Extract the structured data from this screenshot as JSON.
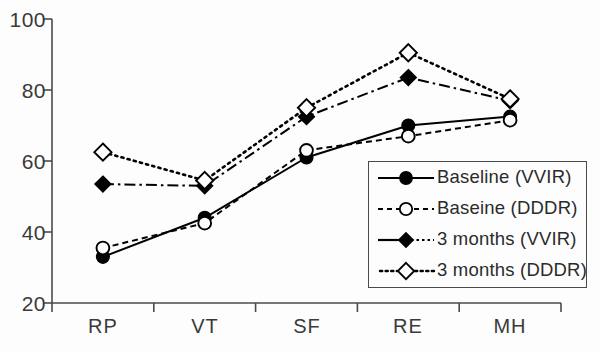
{
  "chart_data": {
    "type": "line",
    "title": "",
    "xlabel": "",
    "ylabel": "",
    "categories": [
      "RP",
      "VT",
      "SF",
      "RE",
      "MH"
    ],
    "ylim": [
      20,
      100
    ],
    "yticks": [
      20,
      40,
      60,
      80,
      100
    ],
    "xticks": [
      "RP",
      "VT",
      "SF",
      "RE",
      "MH"
    ],
    "grid": false,
    "legend_position": "lower-right-inside",
    "series": [
      {
        "name": "Baseline (VVIR)",
        "values": [
          33,
          44,
          61,
          70,
          72.5
        ],
        "marker": "filled-circle",
        "line_style": "solid",
        "color": "#000000"
      },
      {
        "name": "Baseine (DDDR)",
        "values": [
          35.5,
          42.5,
          63,
          67,
          71.5
        ],
        "marker": "open-circle",
        "line_style": "dashed",
        "color": "#000000"
      },
      {
        "name": "3 months (VVIR)",
        "values": [
          53.5,
          53,
          72.5,
          83.5,
          77
        ],
        "marker": "filled-diamond",
        "line_style": "dash-dot",
        "color": "#000000"
      },
      {
        "name": "3 months (DDDR)",
        "values": [
          62.5,
          54.5,
          75,
          90.5,
          77.5
        ],
        "marker": "open-diamond",
        "line_style": "dotted",
        "color": "#000000"
      }
    ]
  },
  "axis": {
    "y_labels": [
      "100",
      "80",
      "60",
      "40",
      "20"
    ],
    "x_labels": [
      "RP",
      "VT",
      "SF",
      "RE",
      "MH"
    ]
  },
  "legend": {
    "items": [
      {
        "label": "Baseline (VVIR)",
        "symbol": "filled-circle-solid-line"
      },
      {
        "label": "Baseine (DDDR)",
        "symbol": "open-circle-dashed-line"
      },
      {
        "label": "3 months (VVIR)",
        "symbol": "filled-diamond-dashdot-line"
      },
      {
        "label": "3 months (DDDR)",
        "symbol": "open-diamond-dotted-line"
      }
    ]
  },
  "colors": {
    "ink": "#000000",
    "axis": "#4a4a4a",
    "background": "#fdfdfd"
  }
}
